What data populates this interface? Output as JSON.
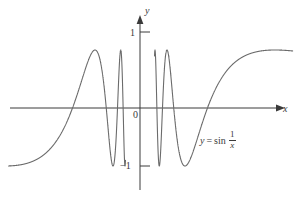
{
  "figure": {
    "background_color": "#ffffff",
    "curve_color": "#6b6b6b",
    "axis_color": "#3a3a3a",
    "text_color": "#3a3a3a"
  },
  "labels": {
    "y_axis": "y",
    "x_axis": "x",
    "origin": "0",
    "tick_one": "1",
    "tick_neg_one": "−1"
  },
  "curve_label": {
    "lhs": "y",
    "equals": "=",
    "fn": "sin",
    "numerator": "1",
    "denominator": "x",
    "full_text": "y = sin 1/x"
  },
  "chart_data": {
    "type": "line",
    "title": "",
    "xlabel": "x",
    "ylabel": "y",
    "function": "y = sin(1/x)",
    "xlim": [
      -0.62,
      0.72
    ],
    "ylim": [
      -1.35,
      1.35
    ],
    "yticks": [
      1,
      -1
    ],
    "ytick_labels": [
      "1",
      "−1"
    ],
    "xticks": [],
    "grid": false,
    "legend": "none",
    "annotations": [
      {
        "text": "y = sin 1/x",
        "x": 0.32,
        "y": -0.42
      },
      {
        "text": "0",
        "x": -0.04,
        "y": -0.13
      }
    ],
    "amplitude": 1,
    "samples_note": "y = sin(1/x) sampled densely near x = 0; curve truncated at plot edges",
    "key_points": [
      {
        "x": -0.6366,
        "y": -1.0,
        "desc": "left minimum of first branch (1/x = -pi/2)"
      },
      {
        "x": -0.3183,
        "y": 0.0,
        "desc": "zero crossing (1/x = -pi)"
      },
      {
        "x": -0.2122,
        "y": 1.0,
        "desc": "maximum (1/x = -3pi/2)"
      },
      {
        "x": -0.1592,
        "y": 0.0,
        "desc": "zero crossing (1/x = -2pi)"
      },
      {
        "x": -0.1273,
        "y": -1.0,
        "desc": "minimum (1/x = -5pi/2)"
      },
      {
        "x": -0.1061,
        "y": 0.0,
        "desc": "zero crossing (1/x = -3pi)"
      },
      {
        "x": -0.0909,
        "y": 1.0,
        "desc": "maximum (1/x = -7pi/2)"
      },
      {
        "x": 0.0909,
        "y": -1.0,
        "desc": "minimum (1/x = 7pi/2... mirrored)"
      },
      {
        "x": 0.1061,
        "y": 0.0,
        "desc": "zero crossing (1/x = 3pi)"
      },
      {
        "x": 0.1273,
        "y": 1.0,
        "desc": "maximum (1/x = 5pi/2)"
      },
      {
        "x": 0.1592,
        "y": 0.0,
        "desc": "zero crossing (1/x = 2pi)"
      },
      {
        "x": 0.2122,
        "y": -1.0,
        "desc": "minimum (1/x = 3pi/2)"
      },
      {
        "x": 0.3183,
        "y": 0.0,
        "desc": "zero crossing (1/x = pi)"
      },
      {
        "x": 0.6366,
        "y": 1.0,
        "desc": "maximum (1/x = pi/2)"
      }
    ]
  }
}
